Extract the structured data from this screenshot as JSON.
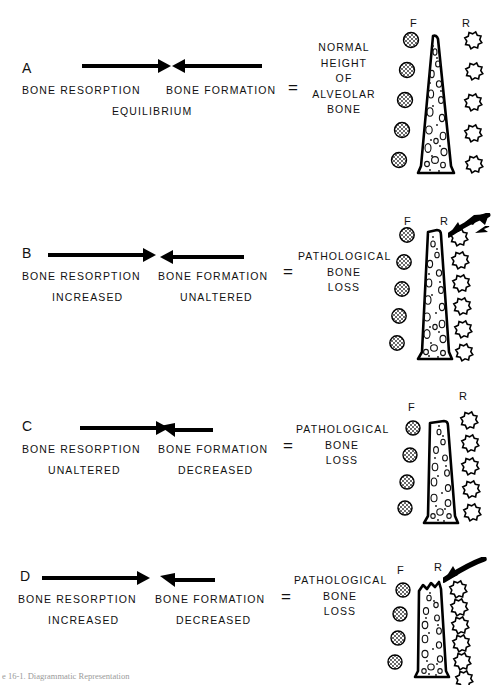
{
  "figure": {
    "caption": "e 16-1.  Diagrammatic Representation",
    "caption_visible_note": "partially cropped at bottom edge"
  },
  "legend": {
    "formation_cell_letter": "F",
    "resorption_cell_letter": "R"
  },
  "panels": [
    {
      "letter": "A",
      "resorption": {
        "label": "BONE RESORPTION",
        "state": "",
        "arrow": "right",
        "arrow_length": "normal"
      },
      "formation": {
        "label": "BONE FORMATION",
        "state": "",
        "arrow": "left",
        "arrow_length": "normal"
      },
      "operator": "=",
      "result": [
        "NORMAL",
        "HEIGHT",
        "OF",
        "ALVEOLAR",
        "BONE"
      ],
      "center_note": "EQUILIBRIUM",
      "f_cells": 5,
      "r_cells": 5,
      "pointer_arrow": false,
      "crest": "sharp-pointed"
    },
    {
      "letter": "B",
      "resorption": {
        "label": "BONE RESORPTION",
        "state": "INCREASED",
        "arrow": "right",
        "arrow_length": "long"
      },
      "formation": {
        "label": "BONE FORMATION",
        "state": "UNALTERED",
        "arrow": "left",
        "arrow_length": "normal"
      },
      "operator": "=",
      "result": [
        "PATHOLOGICAL",
        "BONE",
        "LOSS"
      ],
      "center_note": "",
      "f_cells": 5,
      "r_cells": 6,
      "pointer_arrow": true,
      "crest": "blunted"
    },
    {
      "letter": "C",
      "resorption": {
        "label": "BONE RESORPTION",
        "state": "UNALTERED",
        "arrow": "right",
        "arrow_length": "normal"
      },
      "formation": {
        "label": "BONE FORMATION",
        "state": "DECREASED",
        "arrow": "left",
        "arrow_length": "short"
      },
      "operator": "=",
      "result": [
        "PATHOLOGICAL",
        "BONE",
        "LOSS"
      ],
      "center_note": "",
      "f_cells": 4,
      "r_cells": 5,
      "pointer_arrow": false,
      "crest": "flat-short"
    },
    {
      "letter": "D",
      "resorption": {
        "label": "BONE RESORPTION",
        "state": "INCREASED",
        "arrow": "right",
        "arrow_length": "long"
      },
      "formation": {
        "label": "BONE FORMATION",
        "state": "DECREASED",
        "arrow": "left",
        "arrow_length": "short"
      },
      "operator": "=",
      "result": [
        "PATHOLOGICAL",
        "BONE",
        "LOSS"
      ],
      "center_note": "",
      "f_cells": 4,
      "r_cells": 6,
      "pointer_arrow": true,
      "crest": "ragged-eroded"
    }
  ],
  "colors": {
    "ink": "#000000",
    "background": "#ffffff",
    "cell_fill": "#b9b9b9"
  }
}
